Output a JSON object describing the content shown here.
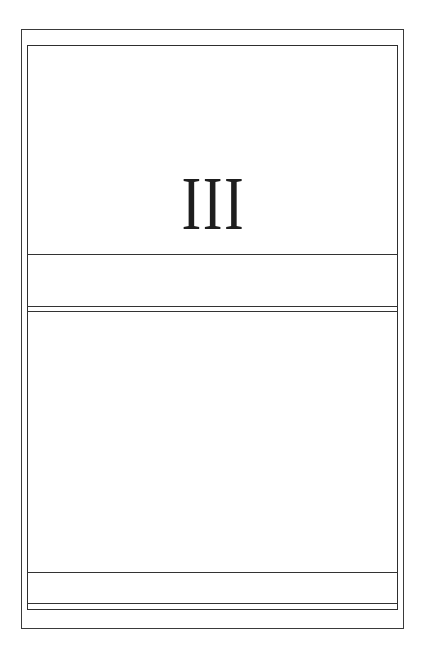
{
  "page": {
    "numeral": "III",
    "colors": {
      "background": "#ffffff",
      "ink": "#1e1e1e",
      "rule": "#333333"
    }
  }
}
